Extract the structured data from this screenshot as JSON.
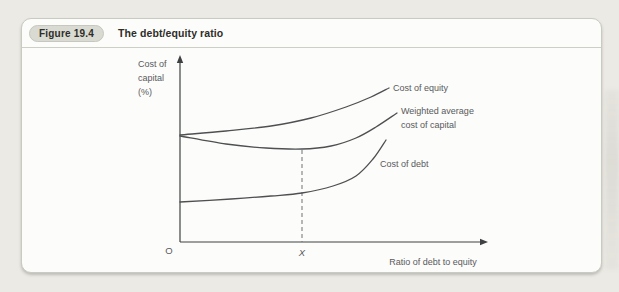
{
  "page": {
    "background_color": "#ECEAE4"
  },
  "figure": {
    "badge_label": "Figure 19.4",
    "title": "The debt/equity ratio",
    "box_background": "#FCFCFA",
    "border_color": "#C7CBC2",
    "badge_background": "#D9DAD2",
    "header_text_color": "#2E2D29"
  },
  "chart_data": {
    "type": "line",
    "title": "The debt/equity ratio",
    "xlabel": "Ratio of debt to equity",
    "ylabel": "Cost of capital (%)",
    "ylabel_lines": [
      "Cost of",
      "capital",
      "(%)"
    ],
    "origin_label": "O",
    "x_marker_label": "X",
    "grid": false,
    "legend_position": "inline-labels-at-curve-ends",
    "axis_note": "qualitative axes, no numeric ticks; X marks the optimal debt/equity ratio where WACC is at its minimum",
    "colors": {
      "axis": "#3F4042",
      "curve": "#4E4F51",
      "label": "#595A5C",
      "dash": "#707173"
    },
    "layout": {
      "origin_x": 179,
      "origin_y": 241,
      "x_arrow_tip": 487,
      "y_arrow_tip": 54,
      "ylabel_x": 137,
      "ylabel_first_baseline": 66,
      "ylabel_line_height": 14,
      "xlabel_anchor_x": 432,
      "xlabel_baseline": 264,
      "origin_label_x": 168,
      "origin_label_baseline": 253,
      "x_marker_x": 301,
      "x_marker_baseline": 255,
      "label_font_size": 9,
      "label_line_height": 14
    },
    "guide_line": {
      "x": 301,
      "y_top": 149,
      "y_bottom": 241,
      "dash_pattern": "4,3"
    },
    "series": [
      {
        "name": "Cost of equity",
        "label_lines": [
          "Cost of equity"
        ],
        "label_x": 392,
        "label_y": 90,
        "points": [
          [
            179,
            134
          ],
          [
            225,
            130
          ],
          [
            270,
            125
          ],
          [
            310,
            117
          ],
          [
            345,
            106
          ],
          [
            370,
            96
          ],
          [
            388,
            87
          ]
        ]
      },
      {
        "name": "Weighted average cost of capital",
        "label_lines": [
          "Weighted average",
          "cost of capital"
        ],
        "label_x": 400,
        "label_y": 113,
        "points": [
          [
            179,
            135
          ],
          [
            225,
            143
          ],
          [
            265,
            147
          ],
          [
            301,
            148
          ],
          [
            330,
            145
          ],
          [
            355,
            137
          ],
          [
            375,
            126
          ],
          [
            396,
            112
          ]
        ]
      },
      {
        "name": "Cost of debt",
        "label_lines": [
          "Cost of debt"
        ],
        "label_x": 379,
        "label_y": 166,
        "points": [
          [
            179,
            201
          ],
          [
            230,
            198
          ],
          [
            270,
            195
          ],
          [
            301,
            192
          ],
          [
            332,
            185
          ],
          [
            355,
            175
          ],
          [
            372,
            158
          ],
          [
            385,
            139
          ]
        ]
      }
    ]
  }
}
